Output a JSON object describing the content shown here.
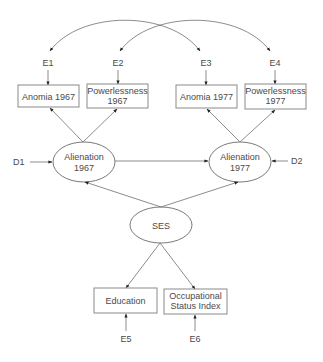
{
  "diagram": {
    "type": "structural-equation-model",
    "observed": [
      {
        "id": "anomia67",
        "lines": [
          "Anomia 1967"
        ]
      },
      {
        "id": "power67",
        "lines": [
          "Powerlessness",
          "1967"
        ]
      },
      {
        "id": "anomia77",
        "lines": [
          "Anomia 1977"
        ]
      },
      {
        "id": "power77",
        "lines": [
          "Powerlessness",
          "1977"
        ]
      },
      {
        "id": "educ",
        "lines": [
          "Education"
        ]
      },
      {
        "id": "occ",
        "lines": [
          "Occupational",
          "Status Index"
        ]
      }
    ],
    "latent": [
      {
        "id": "alien67",
        "lines": [
          "Alienation",
          "1967"
        ]
      },
      {
        "id": "alien77",
        "lines": [
          "Alienation",
          "1977"
        ]
      },
      {
        "id": "ses",
        "lines": [
          "SES"
        ]
      }
    ],
    "errors": [
      {
        "id": "e1",
        "label": "E1",
        "target": "anomia67"
      },
      {
        "id": "e2",
        "label": "E2",
        "target": "power67"
      },
      {
        "id": "e3",
        "label": "E3",
        "target": "anomia77"
      },
      {
        "id": "e4",
        "label": "E4",
        "target": "power77"
      },
      {
        "id": "e5",
        "label": "E5",
        "target": "educ"
      },
      {
        "id": "e6",
        "label": "E6",
        "target": "occ"
      },
      {
        "id": "d1",
        "label": "D1",
        "target": "alien67"
      },
      {
        "id": "d2",
        "label": "D2",
        "target": "alien77"
      }
    ],
    "paths": [
      {
        "from": "alien67",
        "to": "anomia67"
      },
      {
        "from": "alien67",
        "to": "power67"
      },
      {
        "from": "alien77",
        "to": "anomia77"
      },
      {
        "from": "alien77",
        "to": "power77"
      },
      {
        "from": "alien67",
        "to": "alien77"
      },
      {
        "from": "ses",
        "to": "alien67"
      },
      {
        "from": "ses",
        "to": "alien77"
      },
      {
        "from": "ses",
        "to": "educ"
      },
      {
        "from": "ses",
        "to": "occ"
      }
    ],
    "covariances": [
      {
        "between": [
          "e1",
          "e3"
        ]
      },
      {
        "between": [
          "e2",
          "e4"
        ]
      }
    ]
  }
}
